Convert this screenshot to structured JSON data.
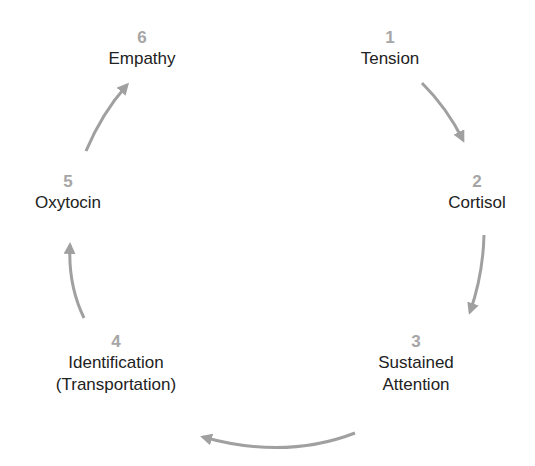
{
  "diagram": {
    "type": "cycle",
    "arrow_color": "#a0a0a0",
    "number_color": "#a6a6a6",
    "label_color": "#222222",
    "nodes": [
      {
        "number": "1",
        "label_lines": [
          "Tension"
        ]
      },
      {
        "number": "2",
        "label_lines": [
          "Cortisol"
        ]
      },
      {
        "number": "3",
        "label_lines": [
          "Sustained",
          "Attention"
        ]
      },
      {
        "number": "4",
        "label_lines": [
          "Identification",
          "(Transportation)"
        ]
      },
      {
        "number": "5",
        "label_lines": [
          "Oxytocin"
        ]
      },
      {
        "number": "6",
        "label_lines": [
          "Empathy"
        ]
      }
    ],
    "edges": [
      {
        "from": "1",
        "to": "2"
      },
      {
        "from": "2",
        "to": "3"
      },
      {
        "from": "3",
        "to": "4"
      },
      {
        "from": "4",
        "to": "5"
      },
      {
        "from": "5",
        "to": "6"
      }
    ]
  }
}
